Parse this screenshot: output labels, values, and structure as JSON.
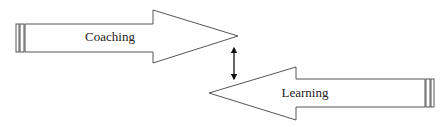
{
  "diagram": {
    "stroke_color": "#555555",
    "text_color": "#222222",
    "background": "#ffffff",
    "nodes": [
      {
        "id": "coaching",
        "label": "Coaching",
        "shape": "block-arrow-right"
      },
      {
        "id": "learning",
        "label": "Learning",
        "shape": "block-arrow-left"
      }
    ],
    "connectors": [
      {
        "from": "coaching",
        "to": "learning",
        "type": "double-headed-arrow",
        "direction": "vertical"
      }
    ]
  }
}
